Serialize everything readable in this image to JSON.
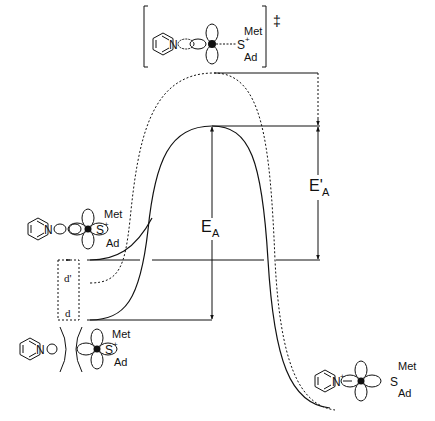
{
  "diagram": {
    "type": "reaction-energy-profile",
    "transition_state": {
      "label_met": "Met",
      "label_s": "S",
      "label_s_charge": "+",
      "label_ad": "Ad",
      "label_n": "N",
      "dagger": "‡"
    },
    "reactant_complex": {
      "label_met": "Met",
      "label_s": "S",
      "label_s_charge": "+",
      "label_ad": "Ad",
      "label_n": "N"
    },
    "separated_reactants": {
      "label_met": "Met",
      "label_s": "S",
      "label_s_charge": "+",
      "label_ad": "Ad",
      "label_n": "N"
    },
    "products": {
      "label_met": "Met",
      "label_s": "S",
      "label_ad": "Ad",
      "label_n": "N",
      "label_n_charge": "+"
    },
    "energy_labels": {
      "ea_main": "E",
      "ea_sub": "A",
      "ea_prime_main": "E'",
      "ea_prime_sub": "A"
    },
    "distance_labels": {
      "d_prime": "d'",
      "d": "d"
    },
    "curves": [
      {
        "name": "solid",
        "style": "solid",
        "start_y": 320,
        "peak_y": 126,
        "end_y": 408
      },
      {
        "name": "dotted",
        "style": "dotted",
        "start_y": 282,
        "peak_y": 73,
        "end_y": 410
      }
    ]
  }
}
